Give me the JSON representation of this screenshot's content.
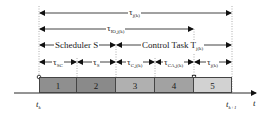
{
  "diagram": {
    "type": "timing-diagram",
    "spans": {
      "total": {
        "symbol": "τ",
        "sub": "j(k)"
      },
      "io": {
        "symbol": "τ",
        "sub": "IO,j(k)"
      },
      "scheduler": {
        "label": "Scheduler S"
      },
      "control_task": {
        "label": "Control Task T",
        "sub": "j(k)"
      }
    },
    "segments": [
      {
        "id": "1",
        "symbol": "τ",
        "sub": "SC",
        "color": "#8f8f8f"
      },
      {
        "id": "2",
        "symbol": "τ",
        "sub": "S",
        "color": "#8a8a8a"
      },
      {
        "id": "3",
        "symbol": "τ",
        "sub": "C,j(k)",
        "color": "#b0b0b0"
      },
      {
        "id": "4",
        "symbol": "τ",
        "sub": "CA,j(k)",
        "color": "#a2a2a2"
      },
      {
        "id": "5",
        "symbol": "τ",
        "sub": "j(k)",
        "color": "#d2d2d2"
      }
    ],
    "axis": {
      "start_label": "t",
      "start_sub": "k",
      "end_label": "t",
      "end_sub": "k+1",
      "axis_label": "t"
    }
  }
}
